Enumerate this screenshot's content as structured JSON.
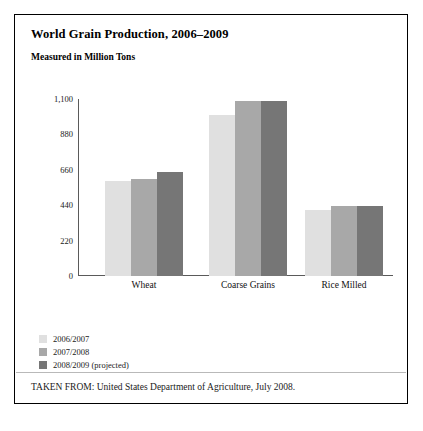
{
  "figure": {
    "title": "World Grain Production, 2006–2009",
    "subtitle": "Measured in Million Tons",
    "source": "TAKEN FROM: United States Department of Agriculture, July 2008."
  },
  "colors": {
    "series_2006_2007": "#e0e0e0",
    "series_2007_2008": "#a8a8a8",
    "series_2008_2009": "#767676",
    "axis": "#5a5a5a",
    "border": "#000000",
    "text": "#1a1a1a",
    "divider": "#b9b9b9",
    "background": "#ffffff"
  },
  "chart_data": {
    "type": "bar",
    "title": "World Grain Production, 2006–2009",
    "subtitle": "Measured in Million Tons",
    "xlabel": "",
    "ylabel": "Million Tons",
    "ylim": [
      0,
      1100
    ],
    "yticks": [
      0,
      220,
      440,
      660,
      880,
      1100
    ],
    "ytick_labels": [
      "0",
      "220",
      "440",
      "660",
      "880",
      "1,100"
    ],
    "grid": false,
    "legend_position": "below-left",
    "categories": [
      "Wheat",
      "Coarse Grains",
      "Rice Milled"
    ],
    "series": [
      {
        "name": "2006/2007",
        "color": "#e0e0e0",
        "values": [
          590,
          1000,
          410
        ]
      },
      {
        "name": "2007/2008",
        "color": "#a8a8a8",
        "values": [
          600,
          1090,
          435
        ]
      },
      {
        "name": "2008/2009 (projected)",
        "color": "#767676",
        "values": [
          645,
          1090,
          435
        ]
      }
    ]
  }
}
